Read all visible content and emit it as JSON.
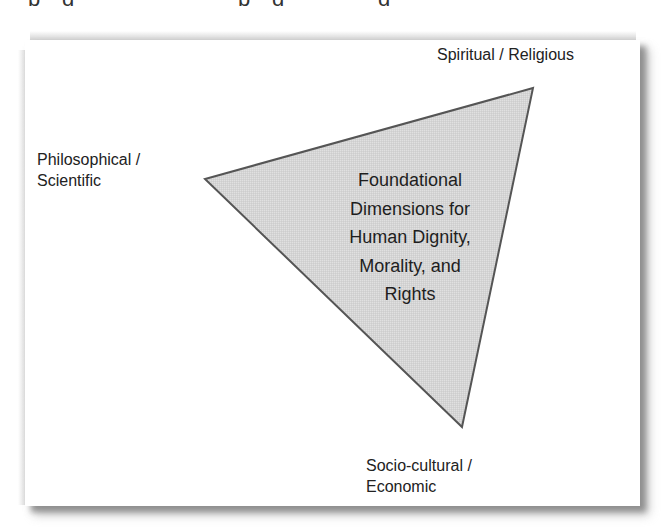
{
  "diagram": {
    "type": "triangle",
    "colors": {
      "triangle_fill": "#d9d9d9",
      "triangle_stroke": "#555555",
      "frame_background": "#ffffff",
      "text": "#222222"
    },
    "vertices": {
      "top_right": {
        "x": 533,
        "y": 88
      },
      "left": {
        "x": 205,
        "y": 179
      },
      "bottom": {
        "x": 462,
        "y": 427
      }
    },
    "center_label": {
      "lines": [
        "Foundational",
        "Dimensions for",
        "Human Dignity,",
        "Morality, and",
        "Rights"
      ]
    },
    "corner_labels": {
      "top_right": {
        "lines": [
          "Spiritual / Religious"
        ]
      },
      "left": {
        "lines": [
          "Philosophical /",
          "Scientific"
        ]
      },
      "bottom": {
        "lines": [
          "Socio-cultural /",
          "Economic"
        ]
      }
    }
  }
}
